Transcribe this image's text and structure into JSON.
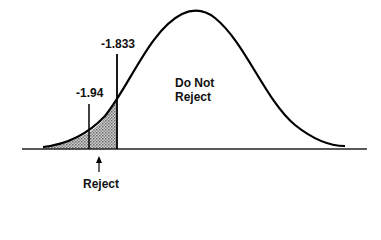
{
  "diagram": {
    "type": "normal-distribution-rejection-region",
    "labels": {
      "critical_value": "-1.833",
      "test_statistic": "-1.94",
      "accept_region_line1": "Do Not",
      "accept_region_line2": "Reject",
      "reject_region": "Reject"
    },
    "colors": {
      "curve": "#000000",
      "shade": "#8a8a8a",
      "text": "#111111"
    }
  }
}
